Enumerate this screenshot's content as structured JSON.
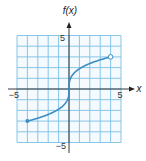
{
  "chart_data": {
    "type": "line",
    "title": "",
    "xlabel": "x",
    "ylabel": "f(x)",
    "xlim": [
      -5,
      5
    ],
    "ylim": [
      -5,
      5
    ],
    "grid": true,
    "x_ticks_labeled": [
      -5,
      5
    ],
    "y_ticks_labeled": [
      5,
      -5
    ],
    "tick_labels": {
      "x_min": "−5",
      "x_max": "5",
      "y_max": "5",
      "y_min": "−5"
    },
    "series": [
      {
        "name": "f(x)",
        "description": "cube-root shaped curve through origin with vertical tangent at x=0",
        "x": [
          -4,
          -3,
          -2,
          -1,
          -0.5,
          -0.1,
          0,
          0.1,
          0.5,
          1,
          2,
          3,
          4
        ],
        "values": [
          -3,
          -2.73,
          -2.38,
          -1.89,
          -1.5,
          -0.88,
          0,
          0.88,
          1.5,
          1.89,
          2.38,
          2.73,
          3
        ],
        "start_point": {
          "x": -4,
          "y": -3,
          "style": "closed"
        },
        "end_point": {
          "x": 4,
          "y": 3,
          "style": "open"
        }
      }
    ],
    "colors": {
      "grid": "#7cc0e4",
      "grid_bg": "#f4fafd",
      "curve": "#3a8cc4",
      "axis": "#222222"
    }
  }
}
